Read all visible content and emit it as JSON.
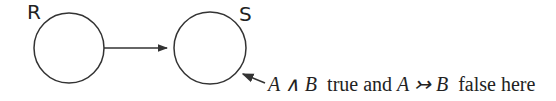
{
  "diagram": {
    "nodes": [
      {
        "id": "R",
        "label": "R"
      },
      {
        "id": "S",
        "label": "S"
      }
    ],
    "edges": [
      {
        "from": "R",
        "to": "S"
      }
    ],
    "annotation": {
      "target": "S",
      "part1": "A ∧ B",
      "part2": "true and",
      "part3": "A ↣ B",
      "part4": "false here"
    }
  }
}
